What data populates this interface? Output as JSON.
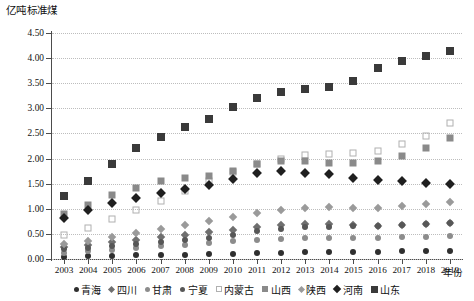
{
  "chart_data": {
    "type": "scatter",
    "title": "",
    "ylabel": "亿吨标准煤",
    "xlabel": "年份",
    "ylim": [
      0.0,
      4.5
    ],
    "ytick_labels": [
      "0.00",
      "0.50",
      "1.00",
      "1.50",
      "2.00",
      "2.50",
      "3.00",
      "3.50",
      "4.00",
      "4.50"
    ],
    "ytick_values": [
      0.0,
      0.5,
      1.0,
      1.5,
      2.0,
      2.5,
      3.0,
      3.5,
      4.0,
      4.5
    ],
    "grid": true,
    "legend_position": "bottom",
    "categories": [
      "2003",
      "2004",
      "2005",
      "2006",
      "2007",
      "2008",
      "2009",
      "2010",
      "2011",
      "2012",
      "2013",
      "2014",
      "2015",
      "2016",
      "2017",
      "2018",
      "2019"
    ],
    "x": [
      2003,
      2004,
      2005,
      2006,
      2007,
      2008,
      2009,
      2010,
      2011,
      2012,
      2013,
      2014,
      2015,
      2016,
      2017,
      2018,
      2019
    ],
    "series": [
      {
        "name": "青海",
        "marker": "circle",
        "color": "#2f2f2f",
        "size": 6,
        "values": [
          0.04,
          0.05,
          0.06,
          0.07,
          0.07,
          0.08,
          0.09,
          0.1,
          0.11,
          0.12,
          0.13,
          0.13,
          0.14,
          0.14,
          0.15,
          0.15,
          0.16
        ]
      },
      {
        "name": "四川",
        "marker": "diamond",
        "color": "#6f6f6f",
        "size": 6,
        "values": [
          0.24,
          0.28,
          0.33,
          0.38,
          0.44,
          0.48,
          0.53,
          0.58,
          0.64,
          0.68,
          0.7,
          0.7,
          0.68,
          0.66,
          0.68,
          0.7,
          0.72
        ]
      },
      {
        "name": "甘肃",
        "marker": "circle",
        "color": "#8c8c8c",
        "size": 6,
        "values": [
          0.12,
          0.15,
          0.18,
          0.21,
          0.25,
          0.28,
          0.31,
          0.35,
          0.38,
          0.4,
          0.42,
          0.42,
          0.42,
          0.42,
          0.43,
          0.44,
          0.45
        ]
      },
      {
        "name": "宁夏",
        "marker": "circle",
        "color": "#575757",
        "size": 6,
        "values": [
          0.19,
          0.22,
          0.26,
          0.3,
          0.34,
          0.38,
          0.42,
          0.48,
          0.55,
          0.6,
          0.63,
          0.64,
          0.65,
          0.66,
          0.68,
          0.7,
          0.72
        ]
      },
      {
        "name": "内蒙古",
        "marker": "square-open",
        "color": "#b0b0b0",
        "size": 7,
        "values": [
          0.48,
          0.62,
          0.8,
          0.98,
          1.15,
          1.35,
          1.55,
          1.73,
          1.9,
          2.0,
          2.08,
          2.1,
          2.12,
          2.16,
          2.28,
          2.45,
          2.7
        ]
      },
      {
        "name": "山西",
        "marker": "square",
        "color": "#8a8a8a",
        "size": 7,
        "values": [
          0.9,
          1.08,
          1.28,
          1.42,
          1.55,
          1.62,
          1.66,
          1.75,
          1.9,
          1.95,
          1.95,
          1.92,
          1.92,
          1.95,
          2.05,
          2.22,
          2.4
        ]
      },
      {
        "name": "陕西",
        "marker": "diamond",
        "color": "#9a9a9a",
        "size": 6,
        "values": [
          0.3,
          0.36,
          0.43,
          0.52,
          0.6,
          0.68,
          0.76,
          0.84,
          0.92,
          0.98,
          1.02,
          1.04,
          1.02,
          1.02,
          1.06,
          1.1,
          1.14
        ]
      },
      {
        "name": "河南",
        "marker": "diamond",
        "color": "#1f1f1f",
        "size": 7,
        "values": [
          0.82,
          0.98,
          1.12,
          1.22,
          1.32,
          1.4,
          1.48,
          1.6,
          1.72,
          1.75,
          1.72,
          1.7,
          1.62,
          1.58,
          1.55,
          1.52,
          1.5
        ]
      },
      {
        "name": "山东",
        "marker": "square",
        "color": "#3a3a3a",
        "size": 8,
        "values": [
          1.25,
          1.55,
          1.9,
          2.22,
          2.42,
          2.62,
          2.78,
          3.02,
          3.2,
          3.32,
          3.38,
          3.42,
          3.55,
          3.8,
          3.95,
          4.05,
          4.15
        ]
      }
    ]
  }
}
